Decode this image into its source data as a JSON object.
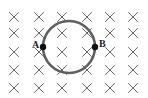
{
  "figure": {
    "field_symbol": "×",
    "field_direction": "into-page",
    "field_grid": {
      "rows": 5,
      "cols": 6
    },
    "points": [
      {
        "id": "A",
        "label": "A",
        "side": "left"
      },
      {
        "id": "B",
        "label": "B",
        "side": "right"
      }
    ],
    "colors": {
      "loop": "#5f5f5f",
      "field_marks": "#555555",
      "points": "#111111",
      "labels": "#222222"
    }
  }
}
